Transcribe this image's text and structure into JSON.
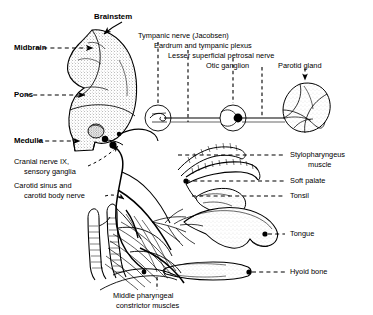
{
  "figure": {
    "style": "black-and-white stippled line drawing"
  },
  "labels": {
    "brainstem": "Brainstem",
    "midbrain": "Midbrain",
    "pons": "Pons",
    "medulla": "Medulla",
    "cranial_nerve_ix_l1": "Cranial nerve IX,",
    "cranial_nerve_ix_l2": "sensory ganglia",
    "carotid_l1": "Carotid sinus and",
    "carotid_l2": "carotid body nerve",
    "tympanic_nerve": "Tympanic nerve (Jacobsen)",
    "eardrum": "Eardrum and tympanic plexus",
    "petrosal": "Lesser superficial petrosal nerve",
    "otic_ganglion": "Otic ganglion",
    "parotid_gland": "Parotid gland",
    "stylopharyngeus_l1": "Stylopharyngeus",
    "stylopharyngeus_l2": "muscle",
    "soft_palate": "Soft palate",
    "tonsil": "Tonsil",
    "tongue": "Tongue",
    "hyoid_bone": "Hyoid bone",
    "constrictor_l1": "Middle pharyngeal",
    "constrictor_l2": "constrictor muscles"
  },
  "colors": {
    "ink": "#000000",
    "background": "#ffffff",
    "stipple": "#4a4a4a"
  }
}
